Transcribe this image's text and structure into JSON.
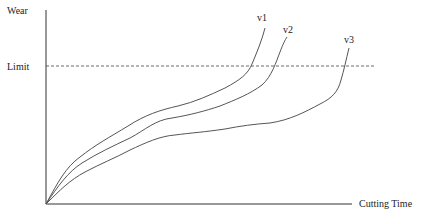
{
  "diagram": {
    "y_axis_label": "Wear",
    "x_axis_label": "Cutting Time",
    "limit_label": "Limit",
    "curves": [
      {
        "label": "v1"
      },
      {
        "label": "v2"
      },
      {
        "label": "v3"
      }
    ],
    "colors": {
      "line": "#444444",
      "axis": "#333333",
      "text": "#222222"
    }
  }
}
